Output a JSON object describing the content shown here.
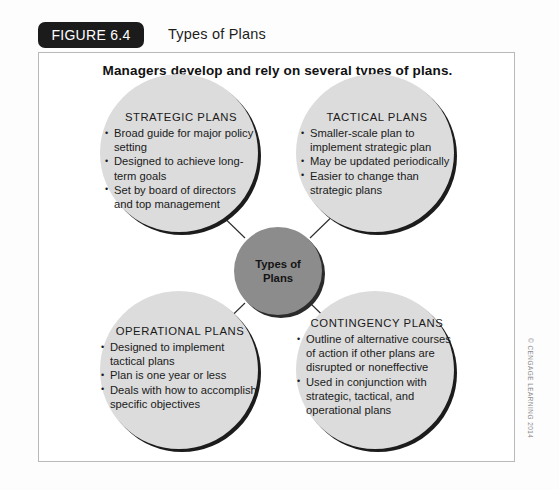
{
  "figure": {
    "badge_label": "FIGURE 6.4",
    "title": "Types of Plans",
    "caption": "Managers develop and rely on several types of plans.",
    "copyright": "© CENGAGE LEARNING 2014"
  },
  "colors": {
    "badge_background": "#1b1b1b",
    "badge_text": "#ffffff",
    "circle_fill": "#dcdcdc",
    "circle_shadow": "#1c1c1c",
    "center_fill": "#8c8c8c",
    "center_shadow": "#2a2a2a",
    "frame_border": "#b9b9b9",
    "arrow": "#2b2b2b",
    "text": "#1a1a1a"
  },
  "center_node": {
    "line1": "Types of",
    "line2": "Plans"
  },
  "nodes": [
    {
      "id": "strategic",
      "heading": "STRATEGIC PLANS",
      "bullets": [
        "Broad guide for major policy setting",
        "Designed to achieve long-term goals",
        "Set by board of directors and top management"
      ]
    },
    {
      "id": "tactical",
      "heading": "TACTICAL PLANS",
      "bullets": [
        "Smaller-scale plan to implement strategic plan",
        "May be updated periodically",
        "Easier to change than strategic plans"
      ]
    },
    {
      "id": "operational",
      "heading": "OPERATIONAL PLANS",
      "bullets": [
        "Designed to implement tactical plans",
        "Plan is one year or less",
        "Deals with how to accomplish specific objectives"
      ]
    },
    {
      "id": "contingency",
      "heading": "CONTINGENCY PLANS",
      "bullets": [
        "Outline of alternative courses of action if other plans are disrupted or noneffective",
        "Used in conjunction with strategic, tactical, and operational plans"
      ]
    }
  ]
}
